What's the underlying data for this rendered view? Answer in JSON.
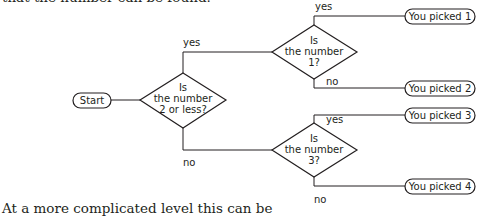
{
  "text": {
    "top_line": "that the number can be found.",
    "bottom_line": "At a more complicated level this can be"
  },
  "flowchart": {
    "start": "Start",
    "decisions": [
      {
        "lines": [
          "Is",
          "the number",
          "2 or less?"
        ]
      },
      {
        "lines": [
          "Is",
          "the number",
          "1?"
        ]
      },
      {
        "lines": [
          "Is",
          "the number",
          "3?"
        ]
      }
    ],
    "edge_labels": {
      "d1_yes": "yes",
      "d1_no": "no",
      "d2_yes": "yes",
      "d2_no": "no",
      "d3_yes": "yes",
      "d3_no": "no"
    },
    "outcomes": [
      "You picked 1",
      "You picked 2",
      "You picked 3",
      "You picked 4"
    ]
  },
  "colors": {
    "ink": "#231f20",
    "background": "#ffffff"
  }
}
